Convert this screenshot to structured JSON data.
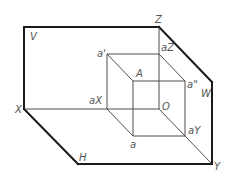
{
  "diagram": {
    "type": "three-plane-projection",
    "planes": {
      "V": "V",
      "H": "H",
      "W": "W"
    },
    "axes": {
      "X": "X",
      "Y": "Y",
      "Z": "Z",
      "origin": "O"
    },
    "points": {
      "space_point": "A",
      "front_projection": "a'",
      "top_projection": "a",
      "side_projection": "a\"",
      "x_axis_projection": "aX",
      "y_axis_projection": "aY",
      "z_axis_projection": "aZ"
    }
  }
}
